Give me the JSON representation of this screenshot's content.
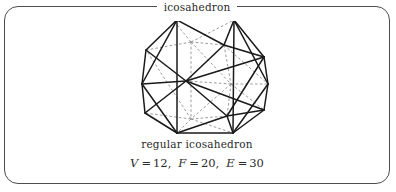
{
  "panel": {
    "legend_title": "icosahedron",
    "border_color": "#4d4d4d",
    "background_color": "#ffffff"
  },
  "caption": {
    "name": "regular icosahedron",
    "formula_parts": {
      "v_symbol": "V",
      "v_equals": "=",
      "v_value": "12",
      "v_separator": ",",
      "f_symbol": "F",
      "f_equals": "=",
      "f_value": "20",
      "f_separator": ",",
      "e_symbol": "E",
      "e_equals": "=",
      "e_value": "30"
    },
    "formula_plain": "V = 12, F = 20, E = 30"
  },
  "figure": {
    "shape_name": "regular icosahedron",
    "visible_edge_color": "#1a1a1a",
    "hidden_edge_color": "#8c8c8c",
    "hidden_edge_style": "dashed",
    "counts": {
      "vertices": 12,
      "faces": 20,
      "edges": 30
    },
    "vertices_px": {
      "top_left": [
        172,
        11
      ],
      "top_right": [
        229,
        11
      ],
      "upper_left_out": [
        141,
        41
      ],
      "upper_mid_left": [
        186,
        33
      ],
      "upper_right_in": [
        219,
        36
      ],
      "right_out": [
        259,
        48
      ],
      "left_mid": [
        137,
        75
      ],
      "center_left": [
        181,
        72
      ],
      "center_right": [
        226,
        75
      ],
      "right_mid": [
        263,
        75
      ],
      "lower_left_in": [
        180,
        110
      ],
      "lower_right_in": [
        222,
        107
      ],
      "bottom_left": [
        172,
        124
      ],
      "bottom_right": [
        228,
        124
      ],
      "left_low": [
        140,
        104
      ],
      "right_low": [
        259,
        101
      ]
    }
  }
}
